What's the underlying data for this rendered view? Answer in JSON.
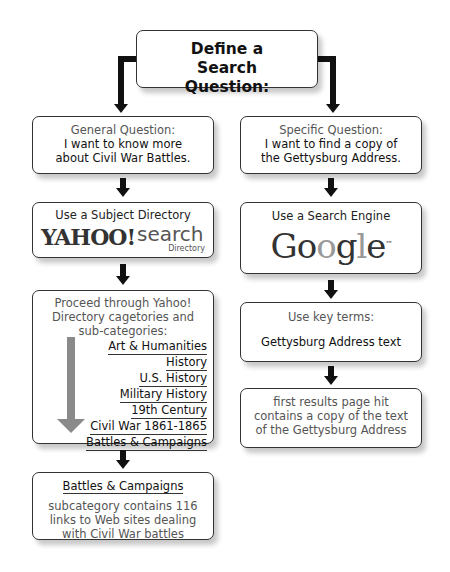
{
  "title": "Define a Search Question:",
  "left": {
    "question_header": "General Question:",
    "question_body": "I want to know more about Civil War Battles.",
    "tool_header": "Use a Subject Directory",
    "logo_main": "YAHOO!",
    "logo_search": "search",
    "logo_sub": "Directory",
    "proceed_text": "Proceed through Yahoo! Directory cagetories and sub-categories:",
    "categories": [
      "Art & Humanities",
      "History",
      "U.S. History",
      "Military History",
      "19th Century",
      "Civil War 1861-1865",
      "Battles & Campaigns"
    ],
    "result_title": "Battles & Campaigns",
    "result_body": "subcategory contains 116 links to Web sites dealing with Civil War battles"
  },
  "right": {
    "question_header": "Specific Question:",
    "question_body": "I want to find a copy of the Gettysburg Address.",
    "tool_header": "Use a Search Engine",
    "logo_letters": [
      "G",
      "o",
      "o",
      "g",
      "l",
      "e"
    ],
    "logo_tm": "™",
    "keyterms_header": "Use key terms:",
    "keyterms_value": "Gettysburg Address text",
    "result_body": "first results page hit contains a copy of the text of the Gettysburg Address"
  },
  "colors": {
    "arrow": "#111111",
    "gray_arrow": "#8a8a8a",
    "border": "#333333"
  }
}
